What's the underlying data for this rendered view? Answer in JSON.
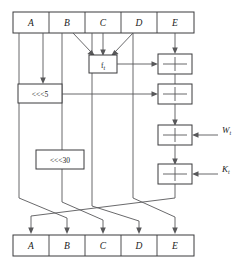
{
  "figure": {
    "stroke_color": "#58585a",
    "box_stroke_color": "#3a3a3c",
    "background_color": "#ffffff"
  },
  "top_register": {
    "name": "input-state-register",
    "cells": [
      {
        "label": "A"
      },
      {
        "label": "B"
      },
      {
        "label": "C"
      },
      {
        "label": "D"
      },
      {
        "label": "E"
      }
    ]
  },
  "bottom_register": {
    "name": "output-state-register",
    "cells": [
      {
        "label": "A"
      },
      {
        "label": "B"
      },
      {
        "label": "C"
      },
      {
        "label": "D"
      },
      {
        "label": "E"
      }
    ]
  },
  "function_box": {
    "name": "round-function-box",
    "label": "f",
    "subscript": "t"
  },
  "rotate_boxes": [
    {
      "name": "rotate-left-5-box",
      "label": "<<<5"
    },
    {
      "name": "rotate-left-30-box",
      "label": "<<<30"
    }
  ],
  "adders": [
    {
      "name": "adder-1",
      "symbol": "+"
    },
    {
      "name": "adder-2",
      "symbol": "+"
    },
    {
      "name": "adder-3",
      "symbol": "+"
    },
    {
      "name": "adder-4",
      "symbol": "+"
    }
  ],
  "side_inputs": [
    {
      "name": "word-input-label",
      "label": "W",
      "subscript": "t"
    },
    {
      "name": "constant-input-label",
      "label": "K",
      "subscript": "t"
    }
  ]
}
